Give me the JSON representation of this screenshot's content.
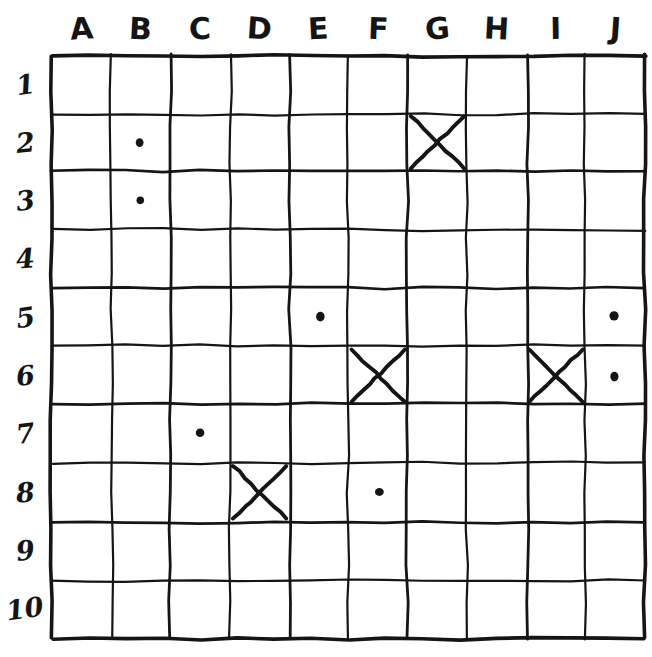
{
  "board": {
    "title": "Battleship grid",
    "columns": [
      "A",
      "B",
      "C",
      "D",
      "E",
      "F",
      "G",
      "H",
      "I",
      "J"
    ],
    "rows": [
      "1",
      "2",
      "3",
      "4",
      "5",
      "6",
      "7",
      "8",
      "9",
      "10"
    ],
    "ink_color": "#151515",
    "paper_color": "#ffffff",
    "grid": {
      "left": 52,
      "top": 55,
      "cell_width": 59.3,
      "cell_height": 58.3,
      "cols": 10,
      "rows": 10
    },
    "marks": [
      {
        "cell": "B2",
        "col": "B",
        "row": "2",
        "type": "dot",
        "meaning": "miss"
      },
      {
        "cell": "G2",
        "col": "G",
        "row": "2",
        "type": "x",
        "meaning": "hit"
      },
      {
        "cell": "B3",
        "col": "B",
        "row": "3",
        "type": "dot",
        "meaning": "miss"
      },
      {
        "cell": "E5",
        "col": "E",
        "row": "5",
        "type": "dot",
        "meaning": "miss"
      },
      {
        "cell": "J5",
        "col": "J",
        "row": "5",
        "type": "dot",
        "meaning": "miss"
      },
      {
        "cell": "F6",
        "col": "F",
        "row": "6",
        "type": "x",
        "meaning": "hit"
      },
      {
        "cell": "I6",
        "col": "I",
        "row": "6",
        "type": "x",
        "meaning": "hit"
      },
      {
        "cell": "J6",
        "col": "J",
        "row": "6",
        "type": "dot",
        "meaning": "miss"
      },
      {
        "cell": "C7",
        "col": "C",
        "row": "7",
        "type": "dot",
        "meaning": "miss"
      },
      {
        "cell": "D8",
        "col": "D",
        "row": "8",
        "type": "x",
        "meaning": "hit"
      },
      {
        "cell": "F8",
        "col": "F",
        "row": "8",
        "type": "dot",
        "meaning": "miss"
      }
    ],
    "counts": {
      "dots": "7",
      "crosses": "4"
    }
  }
}
